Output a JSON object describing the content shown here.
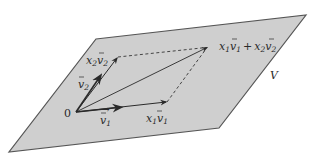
{
  "diagram": {
    "type": "vector-addition-in-plane",
    "plane": {
      "label": "V",
      "fill": "#cfcfcf",
      "stroke": "#555555",
      "corners": [
        [
          96,
          39
        ],
        [
          306,
          15
        ],
        [
          219,
          128
        ],
        [
          9,
          152
        ]
      ]
    },
    "origin": {
      "label": "0",
      "point": [
        76,
        112
      ]
    },
    "vectors": [
      {
        "id": "v1",
        "label_base": "v",
        "label_sub": "1",
        "from": [
          76,
          112
        ],
        "to": [
          118,
          108
        ],
        "style": "solid-thick"
      },
      {
        "id": "x1v1",
        "label_coef": "x",
        "label_coef_sub": "1",
        "label_base": "v",
        "label_sub": "1",
        "from": [
          76,
          112
        ],
        "to": [
          167,
          102
        ],
        "style": "solid"
      },
      {
        "id": "v2",
        "label_base": "v",
        "label_sub": "2",
        "from": [
          76,
          112
        ],
        "to": [
          100,
          76
        ],
        "style": "solid-thick"
      },
      {
        "id": "x2v2",
        "label_coef": "x",
        "label_coef_sub": "2",
        "label_base": "v",
        "label_sub": "2",
        "from": [
          76,
          112
        ],
        "to": [
          118,
          57
        ],
        "style": "solid"
      },
      {
        "id": "sum",
        "from": [
          76,
          112
        ],
        "to": [
          208,
          47
        ],
        "style": "solid-thin"
      }
    ],
    "dashed_edges": [
      {
        "from": [
          118,
          57
        ],
        "to": [
          208,
          47
        ]
      },
      {
        "from": [
          167,
          102
        ],
        "to": [
          208,
          47
        ]
      }
    ],
    "labels": {
      "origin": "0",
      "v1": {
        "base": "v",
        "sub": "1"
      },
      "v2": {
        "base": "v",
        "sub": "2"
      },
      "x1v1": {
        "coef": "x",
        "coef_sub": "1",
        "base": "v",
        "sub": "1"
      },
      "x2v2": {
        "coef": "x",
        "coef_sub": "2",
        "base": "v",
        "sub": "2"
      },
      "sum": {
        "text": "x₁v₁ + x₂v₂",
        "term1_coef": "x",
        "term1_coef_sub": "1",
        "term1_base": "v",
        "term1_sub": "1",
        "plus": "+",
        "term2_coef": "x",
        "term2_coef_sub": "2",
        "term2_base": "v",
        "term2_sub": "2"
      },
      "plane": "V"
    },
    "colors": {
      "plane_fill": "#cfcfcf",
      "plane_edge": "#555555",
      "vector": "#2a2a2a",
      "text": "#2a2a2a",
      "background": "#ffffff"
    }
  }
}
